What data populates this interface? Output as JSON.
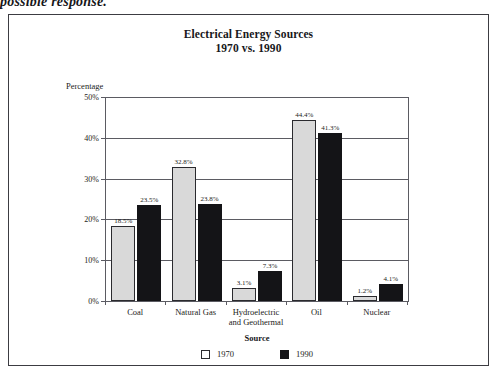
{
  "page": {
    "top_caption": "possible response."
  },
  "figure": {
    "title": "Electrical Energy Sources",
    "subtitle": "1970 vs. 1990",
    "yaxis_title": "Percentage",
    "xaxis_title": "Source"
  },
  "legend": {
    "title": "Source",
    "items": [
      {
        "label": "1970",
        "swatch": "light-swatch-icon",
        "color": "#ffffff"
      },
      {
        "label": "1990",
        "swatch": "dark-swatch-icon",
        "color": "#141417"
      }
    ]
  },
  "yaxis": {
    "ticks": [
      "0%",
      "10%",
      "20%",
      "30%",
      "40%",
      "50%"
    ],
    "values": [
      0,
      10,
      20,
      30,
      40,
      50
    ]
  },
  "chart_data": {
    "type": "bar",
    "title": "Electrical Energy Sources 1970 vs. 1990",
    "xlabel": "Source",
    "ylabel": "Percentage",
    "ylim": [
      0,
      50
    ],
    "ytick_values": [
      0,
      10,
      20,
      30,
      40,
      50
    ],
    "ytick_labels": [
      "0%",
      "10%",
      "20%",
      "30%",
      "40%",
      "50%"
    ],
    "grid": true,
    "legend_position": "bottom-center",
    "legend_title": "Source",
    "categories": [
      "Coal",
      "Natural Gas",
      "Hydroelectric\nand Geothermal",
      "Oil",
      "Nuclear"
    ],
    "series": [
      {
        "name": "1970",
        "color": "#d9d9d9",
        "values": [
          18.5,
          32.8,
          3.1,
          44.4,
          1.2
        ],
        "value_labels": [
          "18.5%",
          "32.8%",
          "3.1%",
          "44.4%",
          "1.2%"
        ]
      },
      {
        "name": "1990",
        "color": "#141417",
        "values": [
          23.5,
          23.8,
          7.3,
          41.3,
          4.1
        ],
        "value_labels": [
          "23.5%",
          "23.8%",
          "7.3%",
          "41.3%",
          "4.1%"
        ]
      }
    ]
  }
}
